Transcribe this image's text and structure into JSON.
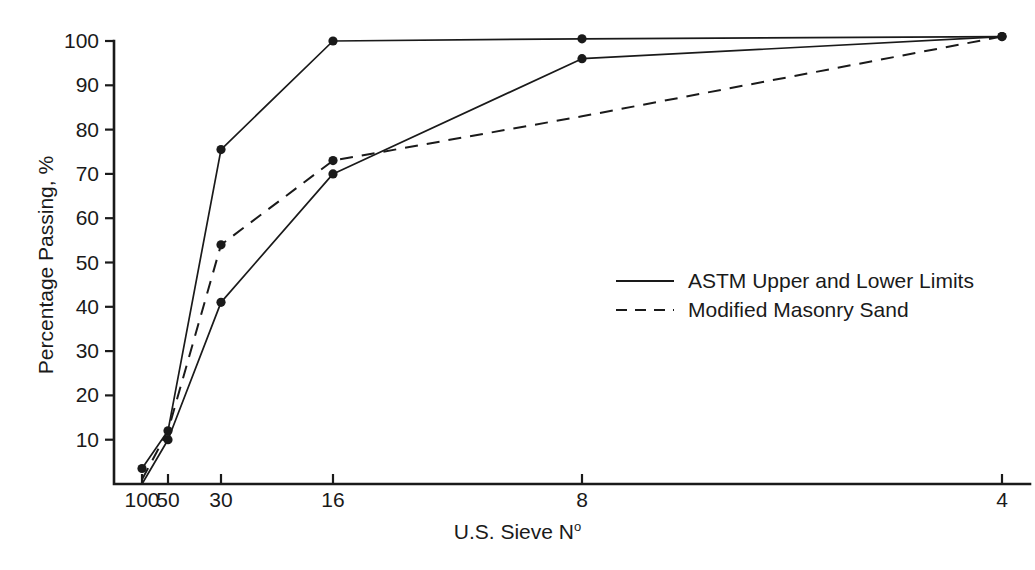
{
  "chart_data": {
    "type": "line",
    "title": "",
    "xlabel": "U.S. Sieve Nº",
    "ylabel": "Percentage Passing, %",
    "xlabel_main": "U.S. Sieve N",
    "xlabel_superscript": "o",
    "x_tick_labels": [
      "100",
      "50",
      "30",
      "16",
      "8",
      "4"
    ],
    "x_tick_values": [
      100,
      50,
      30,
      16,
      8,
      4
    ],
    "y_tick_labels": [
      "10",
      "20",
      "30",
      "40",
      "50",
      "60",
      "70",
      "80",
      "90",
      "100"
    ],
    "y_tick_values": [
      10,
      20,
      30,
      40,
      50,
      60,
      70,
      80,
      90,
      100
    ],
    "ylim": [
      0,
      100
    ],
    "grid": false,
    "legend_position": "center-right",
    "series": [
      {
        "name": "ASTM Upper Limit",
        "legend_key": "ASTM Upper and Lower Limits",
        "style": "solid",
        "x": [
          100,
          50,
          30,
          16,
          8,
          4
        ],
        "values": [
          3.5,
          12.0,
          75.5,
          100.0,
          100.5,
          101.0
        ],
        "markers_at": [
          100,
          30,
          16,
          8,
          4
        ]
      },
      {
        "name": "ASTM Lower Limit",
        "legend_key": "ASTM Upper and Lower Limits",
        "style": "solid",
        "x": [
          100,
          50,
          30,
          16,
          8,
          4
        ],
        "values": [
          0.0,
          10.0,
          41.0,
          70.0,
          96.0,
          101.0
        ],
        "markers_at": [
          50,
          30,
          16,
          8,
          4
        ]
      },
      {
        "name": "Modified Masonry Sand",
        "legend_key": "Modified Masonry Sand",
        "style": "dashed",
        "x": [
          100,
          50,
          30,
          16,
          8,
          4
        ],
        "values": [
          1.0,
          12.0,
          54.0,
          73.0,
          83.0,
          101.0
        ],
        "markers_at": [
          50,
          30,
          16
        ]
      }
    ],
    "legend": [
      {
        "label": "ASTM Upper and Lower Limits",
        "style": "solid"
      },
      {
        "label": "Modified Masonry Sand",
        "style": "dashed"
      }
    ],
    "colors": {
      "line": "#1a1a1a",
      "background": "#ffffff"
    }
  }
}
